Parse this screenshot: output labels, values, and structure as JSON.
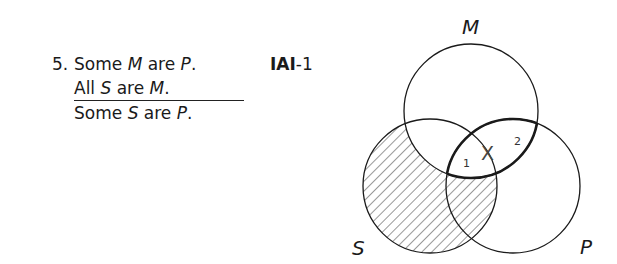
{
  "problem": {
    "number": "5.",
    "premise1": {
      "pre": "Some ",
      "term1": "M",
      "mid": " are ",
      "term2": "P",
      "post": "."
    },
    "premise2": {
      "pre": "All ",
      "term1": "S",
      "mid": " are ",
      "term2": "M",
      "post": "."
    },
    "conclusion": {
      "pre": "Some ",
      "term1": "S",
      "mid": " are ",
      "term2": "P",
      "post": "."
    }
  },
  "form": {
    "mood": "IAI",
    "figure": "-1"
  },
  "venn": {
    "circles": [
      {
        "label": "M",
        "cx": 471,
        "cy": 111,
        "r": 67
      },
      {
        "label": "S",
        "cx": 430,
        "cy": 186,
        "r": 67
      },
      {
        "label": "P",
        "cx": 513,
        "cy": 186,
        "r": 67
      }
    ],
    "shaded_region": "S outside M",
    "x_mark": "X",
    "x_region_labels": [
      "1",
      "2"
    ],
    "stroke_color": "#1a1a1a"
  }
}
